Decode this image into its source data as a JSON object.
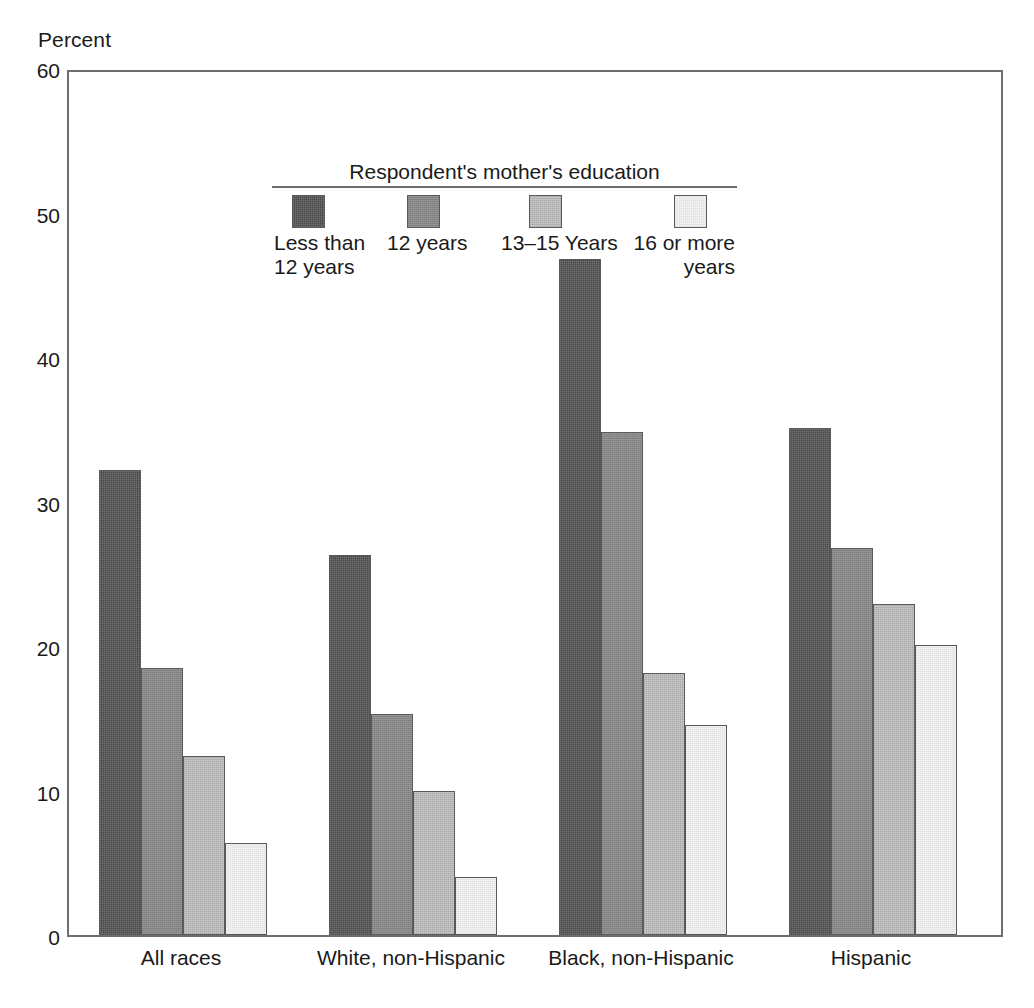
{
  "axis": {
    "y_caption": "Percent",
    "y_ticks": [
      "60",
      "50",
      "40",
      "30",
      "20",
      "10",
      "0"
    ]
  },
  "legend": {
    "title": "Respondent's mother's education",
    "items": [
      {
        "label": "Less than\n12 years",
        "color": "#4b4b4b",
        "swatch_name": "less-than-12-years"
      },
      {
        "label": "12 years",
        "color": "#858585",
        "swatch_name": "12-years"
      },
      {
        "label": "13–15 Years",
        "color": "#c9c9c9",
        "swatch_name": "13-15-years"
      },
      {
        "label": "16 or more\nyears",
        "color": "#f4f4f4",
        "swatch_name": "16-or-more-years"
      }
    ]
  },
  "groups": [
    {
      "label": "All races"
    },
    {
      "label": "White, non-Hispanic"
    },
    {
      "label": "Black, non-Hispanic"
    },
    {
      "label": "Hispanic"
    }
  ],
  "chart_data": {
    "type": "bar",
    "title": "",
    "xlabel": "",
    "ylabel": "Percent",
    "ylim": [
      0,
      60
    ],
    "yticks": [
      0,
      10,
      20,
      30,
      40,
      50,
      60
    ],
    "grid": false,
    "legend_position": "inside-top-left",
    "legend_title": "Respondent's mother's education",
    "categories": [
      "All races",
      "White, non-Hispanic",
      "Black, non-Hispanic",
      "Hispanic"
    ],
    "series": [
      {
        "name": "Less than 12 years",
        "color": "#4b4b4b",
        "values": [
          32.2,
          26.3,
          46.8,
          35.1
        ]
      },
      {
        "name": "12 years",
        "color": "#858585",
        "values": [
          18.5,
          15.3,
          34.8,
          26.8
        ]
      },
      {
        "name": "13–15 Years",
        "color": "#c9c9c9",
        "values": [
          12.4,
          10.0,
          18.1,
          22.9
        ]
      },
      {
        "name": "16 or more years",
        "color": "#f4f4f4",
        "values": [
          6.4,
          4.0,
          14.5,
          20.1
        ]
      }
    ]
  }
}
